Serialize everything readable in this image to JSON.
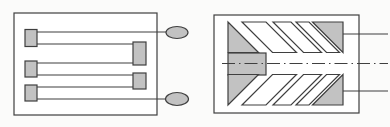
{
  "figure": {
    "width": 390,
    "height": 127,
    "background": "#fbfbfa",
    "stroke_color": "#3f3f3f",
    "stroke_width": 1.2,
    "gray_fill": "#c2c2c2",
    "white_fill": "#ffffff",
    "centerline_dash": "13 4 1.5 4",
    "panels": [
      {
        "name": "meander-electrode-pattern",
        "shapes": [
          {
            "type": "rect",
            "name": "substrate-outline",
            "x": 14,
            "y": 13,
            "w": 143,
            "h": 102,
            "fill": "white"
          },
          {
            "type": "line",
            "name": "lead-line-top",
            "x1": 37,
            "y1": 32,
            "x2": 166,
            "y2": 32
          },
          {
            "type": "line",
            "name": "meander-trace",
            "x1": 37,
            "y1": 44,
            "x2": 133,
            "y2": 44
          },
          {
            "type": "line",
            "name": "meander-trace",
            "x1": 37,
            "y1": 63,
            "x2": 133,
            "y2": 63
          },
          {
            "type": "line",
            "name": "meander-trace",
            "x1": 37,
            "y1": 75,
            "x2": 133,
            "y2": 75
          },
          {
            "type": "line",
            "name": "meander-trace",
            "x1": 37,
            "y1": 87,
            "x2": 133,
            "y2": 87
          },
          {
            "type": "line",
            "name": "lead-line-bottom",
            "x1": 37,
            "y1": 99,
            "x2": 166,
            "y2": 99
          },
          {
            "type": "rect",
            "name": "turn-pad-left-1",
            "x": 25,
            "y": 29.5,
            "w": 12,
            "h": 17,
            "fill": "gray"
          },
          {
            "type": "rect",
            "name": "turn-pad-right-1",
            "x": 133,
            "y": 42,
            "w": 13,
            "h": 23,
            "fill": "gray"
          },
          {
            "type": "rect",
            "name": "turn-pad-left-2",
            "x": 25,
            "y": 61,
            "w": 12,
            "h": 16,
            "fill": "gray"
          },
          {
            "type": "rect",
            "name": "turn-pad-right-2",
            "x": 133,
            "y": 73,
            "w": 13,
            "h": 16,
            "fill": "gray"
          },
          {
            "type": "rect",
            "name": "turn-pad-left-3",
            "x": 25,
            "y": 85,
            "w": 12,
            "h": 16,
            "fill": "gray"
          },
          {
            "type": "ellipse",
            "name": "terminal-top",
            "cx": 177,
            "cy": 32.5,
            "rx": 11,
            "ry": 6,
            "fill": "gray"
          },
          {
            "type": "ellipse",
            "name": "terminal-bottom",
            "cx": 177,
            "cy": 99,
            "rx": 11.5,
            "ry": 6.5,
            "fill": "gray"
          }
        ]
      },
      {
        "name": "herringbone-electrode-pattern",
        "shapes": [
          {
            "type": "rect",
            "name": "substrate-outline",
            "x": 214,
            "y": 15,
            "w": 145,
            "h": 98,
            "fill": "white"
          },
          {
            "type": "rect",
            "name": "center-contact-block",
            "x": 228,
            "y": 53,
            "w": 38,
            "h": 22,
            "fill": "gray"
          },
          {
            "type": "polygon",
            "name": "corner-triangle-top-left",
            "points": "228,22 228,52.5 258.5,52.5",
            "fill": "gray"
          },
          {
            "type": "polygon",
            "name": "corner-triangle-bottom-left",
            "points": "228,74.5 258.5,74.5 228,105",
            "fill": "gray"
          },
          {
            "type": "polygon",
            "name": "corner-triangle-top-right",
            "points": "312.5,22 343,22 343,52.5",
            "fill": "gray"
          },
          {
            "type": "polygon",
            "name": "corner-triangle-bottom-right",
            "points": "343,74.5 343,105 312.5,105",
            "fill": "gray"
          },
          {
            "type": "polygon",
            "name": "chevron-stripe-top-1",
            "points": "242,22 266,22 296.5,52.5 272.5,52.5",
            "fill": "white"
          },
          {
            "type": "polygon",
            "name": "chevron-stripe-top-2",
            "points": "273,22 291,22 321.5,52.5 303.5,52.5",
            "fill": "white"
          },
          {
            "type": "polygon",
            "name": "chevron-stripe-top-3",
            "points": "296,22 309,22 339.5,52.5 326.5,52.5",
            "fill": "white"
          },
          {
            "type": "polygon",
            "name": "chevron-stripe-bottom-1",
            "points": "242,105 266,105 296.5,74.5 272.5,74.5",
            "fill": "white"
          },
          {
            "type": "polygon",
            "name": "chevron-stripe-bottom-2",
            "points": "273,105 291,105 321.5,74.5 303.5,74.5",
            "fill": "white"
          },
          {
            "type": "polygon",
            "name": "chevron-stripe-bottom-3",
            "points": "296,105 309,105 339.5,74.5 326.5,74.5",
            "fill": "white"
          },
          {
            "type": "line",
            "name": "lead-line-top",
            "x1": 343,
            "y1": 34,
            "x2": 388,
            "y2": 34
          },
          {
            "type": "line",
            "name": "lead-line-bottom",
            "x1": 343,
            "y1": 91,
            "x2": 388,
            "y2": 91
          },
          {
            "type": "line",
            "name": "symmetry-axis-dash-dot-line",
            "x1": 222,
            "y1": 63.5,
            "x2": 388,
            "y2": 63.5,
            "dash": true
          }
        ]
      }
    ]
  }
}
